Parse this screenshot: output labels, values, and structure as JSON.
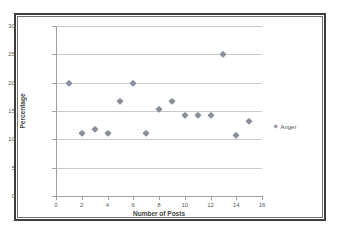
{
  "chart_data": {
    "type": "scatter",
    "title": "",
    "xlabel": "Number of Posts",
    "ylabel": "Percentage",
    "xlim": [
      0,
      16
    ],
    "ylim": [
      0,
      30
    ],
    "xticks": [
      0,
      2,
      4,
      6,
      8,
      10,
      12,
      14,
      16
    ],
    "yticks": [
      0,
      5,
      10,
      15,
      20,
      25,
      30
    ],
    "grid": "horizontal",
    "legend_position": "right",
    "marker": "diamond",
    "series": [
      {
        "name": "Anger",
        "color": "#8a8f9c",
        "points": [
          {
            "x": 1,
            "y": 20
          },
          {
            "x": 2,
            "y": 11.1
          },
          {
            "x": 3,
            "y": 11.8
          },
          {
            "x": 4,
            "y": 11.1
          },
          {
            "x": 5,
            "y": 16.7
          },
          {
            "x": 6,
            "y": 20
          },
          {
            "x": 7,
            "y": 11.1
          },
          {
            "x": 8,
            "y": 15.4
          },
          {
            "x": 9,
            "y": 16.7
          },
          {
            "x": 10,
            "y": 14.3
          },
          {
            "x": 11,
            "y": 14.3
          },
          {
            "x": 12,
            "y": 14.3
          },
          {
            "x": 13,
            "y": 25
          },
          {
            "x": 14,
            "y": 10.7
          },
          {
            "x": 15,
            "y": 13.2
          }
        ]
      }
    ]
  },
  "legend": {
    "entries": [
      {
        "label": "Anger"
      }
    ]
  },
  "axis_labels": {
    "x_title": "Number of Posts",
    "y_title": "Percentage"
  }
}
